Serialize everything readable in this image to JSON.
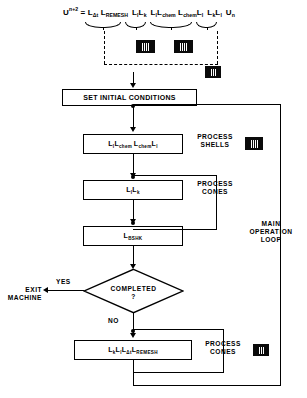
{
  "diagram": {
    "equation": {
      "lhs_base": "U",
      "lhs_sup": "n+2",
      "equals": "=",
      "terms": [
        {
          "base": "L",
          "sub": "Δt"
        },
        {
          "base": "L",
          "sub": "REMESH"
        },
        {
          "base": "L",
          "sub": "l"
        },
        {
          "base": "L",
          "sub": "k"
        },
        {
          "base": "L",
          "sub": "l"
        },
        {
          "base": "L",
          "sub": "chem"
        },
        {
          "base": "L",
          "sub": "chem"
        },
        {
          "base": "L",
          "sub": "l"
        },
        {
          "base": "L",
          "sub": "k"
        },
        {
          "base": "L",
          "sub": "l"
        },
        {
          "base": "U",
          "sub": "n"
        }
      ]
    },
    "nodes": {
      "set_initial_conditions": "SET INITIAL CONDITIONS",
      "process_shells_box": [
        {
          "base": "L",
          "sub": "l"
        },
        {
          "base": "L",
          "sub": "chem"
        },
        {
          "base": "L",
          "sub": "chem"
        },
        {
          "base": "L",
          "sub": "l"
        }
      ],
      "process_cones_box": [
        {
          "base": "L",
          "sub": "l"
        },
        {
          "base": "L",
          "sub": "k"
        }
      ],
      "bshk_box": [
        {
          "base": "L",
          "sub": "BSHK"
        }
      ],
      "remesh_box": [
        {
          "base": "L",
          "sub": "k"
        },
        {
          "base": "L",
          "sub": "l"
        },
        {
          "base": "L",
          "sub": "Δt"
        },
        {
          "base": "L",
          "sub": "REMESH"
        }
      ],
      "decision_line1": "COMPLETED",
      "decision_line2": "?"
    },
    "labels": {
      "exit_line1": "EXIT",
      "exit_line2": "MACHINE",
      "yes": "YES",
      "no": "NO",
      "process_shells_line1": "PROCESS",
      "process_shells_line2": "SHELLS",
      "process_cones_line1": "PROCESS",
      "process_cones_line2": "CONES",
      "process_cones2_line1": "PROCESS",
      "process_cones2_line2": "CONES",
      "main_loop_line1": "MAIN",
      "main_loop_line2": "OPERATION",
      "main_loop_line3": "LOOP"
    },
    "icons": {
      "comb": "comb-icon"
    },
    "colors": {
      "line": "#000000",
      "background": "#ffffff",
      "icon_fill": "#0a0a0a"
    }
  }
}
